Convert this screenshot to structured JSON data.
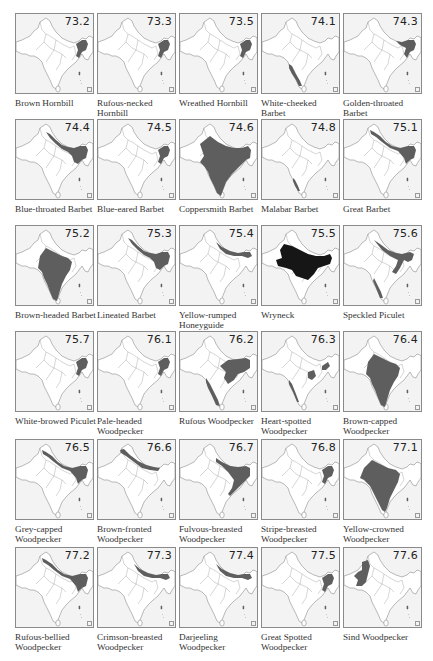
{
  "figure": {
    "colors": {
      "range_fill": "#5e5e5e",
      "range_dark": "#161616",
      "land": "#ffffff",
      "sea": "#f3f3f3",
      "border": "#7a7a7a"
    },
    "panels": [
      {
        "num": "73.2",
        "name": "Brown Hornbill",
        "shade": "ne",
        "tone": "mid"
      },
      {
        "num": "73.3",
        "name": "Rufous-necked Hornbill",
        "shade": "ne",
        "tone": "mid"
      },
      {
        "num": "73.5",
        "name": "Wreathed Hornbill",
        "shade": "ne",
        "tone": "mid"
      },
      {
        "num": "74.1",
        "name": "White-cheeked Barbet",
        "shade": "wghats",
        "tone": "mid"
      },
      {
        "num": "74.3",
        "name": "Golden-throated Barbet",
        "shade": "ehimal_ne",
        "tone": "mid"
      },
      {
        "num": "74.4",
        "name": "Blue-throated Barbet",
        "shade": "himal_ne_big",
        "tone": "mid"
      },
      {
        "num": "74.5",
        "name": "Blue-eared Barbet",
        "shade": "ne",
        "tone": "mid"
      },
      {
        "num": "74.6",
        "name": "Coppersmith Barbet",
        "shade": "india_most",
        "tone": "mid"
      },
      {
        "num": "74.8",
        "name": "Malabar Barbet",
        "shade": "wghats_s",
        "tone": "mid"
      },
      {
        "num": "75.1",
        "name": "Great Barbet",
        "shade": "himal_full",
        "tone": "mid"
      },
      {
        "num": "75.2",
        "name": "Brown-headed Barbet",
        "shade": "peninsula",
        "tone": "mid"
      },
      {
        "num": "75.3",
        "name": "Lineated Barbet",
        "shade": "himal_ne_big",
        "tone": "mid"
      },
      {
        "num": "75.4",
        "name": "Yellow-rumped Honeyguide",
        "shade": "himal_mid",
        "tone": "mid"
      },
      {
        "num": "75.5",
        "name": "Wryneck",
        "shade": "north_plains",
        "tone": "dark"
      },
      {
        "num": "75.6",
        "name": "Speckled Piculet",
        "shade": "piculet",
        "tone": "mid"
      },
      {
        "num": "75.7",
        "name": "White-browed Piculet",
        "shade": "ne",
        "tone": "mid"
      },
      {
        "num": "76.1",
        "name": "Pale-headed Woodpecker",
        "shade": "ne",
        "tone": "mid"
      },
      {
        "num": "76.2",
        "name": "Rufous Woodpecker",
        "shade": "rufous",
        "tone": "mid"
      },
      {
        "num": "76.3",
        "name": "Heart-spotted Woodpecker",
        "shade": "heart",
        "tone": "mid"
      },
      {
        "num": "76.4",
        "name": "Brown-capped Woodpecker",
        "shade": "peninsula",
        "tone": "mid"
      },
      {
        "num": "76.5",
        "name": "Grey-capped Woodpecker",
        "shade": "himal_full",
        "tone": "mid"
      },
      {
        "num": "76.6",
        "name": "Brown-fronted Woodpecker",
        "shade": "himal_west",
        "tone": "mid"
      },
      {
        "num": "76.7",
        "name": "Fulvous-breasted Woodpecker",
        "shade": "fulvous",
        "tone": "mid"
      },
      {
        "num": "76.8",
        "name": "Stripe-breasted Woodpecker",
        "shade": "ne",
        "tone": "mid"
      },
      {
        "num": "77.1",
        "name": "Yellow-crowned Woodpecker",
        "shade": "peninsula_w",
        "tone": "mid"
      },
      {
        "num": "77.2",
        "name": "Rufous-bellied Woodpecker",
        "shade": "himal_full",
        "tone": "mid"
      },
      {
        "num": "77.3",
        "name": "Crimson-breasted Woodpecker",
        "shade": "himal_mid",
        "tone": "mid"
      },
      {
        "num": "77.4",
        "name": "Darjeeling Woodpecker",
        "shade": "himal_mid",
        "tone": "mid"
      },
      {
        "num": "77.5",
        "name": "Great Spotted Woodpecker",
        "shade": "ne",
        "tone": "mid"
      },
      {
        "num": "77.6",
        "name": "Sind Woodpecker",
        "shade": "sind",
        "tone": "mid"
      }
    ]
  }
}
